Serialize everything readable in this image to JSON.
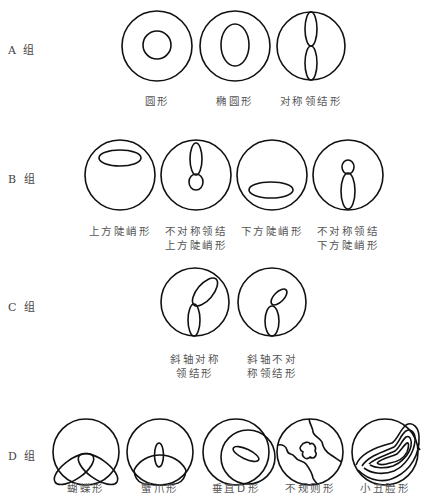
{
  "groups": [
    {
      "label": "A 组",
      "shapes": [
        {
          "name": "圆形"
        },
        {
          "name": "椭圆形"
        },
        {
          "name": "对称领结形"
        }
      ]
    },
    {
      "label": "B 组",
      "shapes": [
        {
          "name": "上方陡峭形"
        },
        {
          "name_line1": "不对称领结",
          "name_line2": "上方陡峭形"
        },
        {
          "name": "下方陡峭形"
        },
        {
          "name_line1": "不对称领结",
          "name_line2": "下方陡峭形"
        }
      ]
    },
    {
      "label": "C 组",
      "shapes": [
        {
          "name_line1": "斜轴对称",
          "name_line2": "领结形"
        },
        {
          "name_line1": "斜轴不对",
          "name_line2": "称领结形"
        }
      ]
    },
    {
      "label": "D 组",
      "shapes": [
        {
          "name": "蝴蝶形"
        },
        {
          "name": "蟹爪形"
        },
        {
          "name": "垂直D形"
        },
        {
          "name": "不规则形"
        },
        {
          "name": "小丑脸形"
        }
      ]
    }
  ],
  "colors": {
    "stroke": "#111111",
    "text": "#555555",
    "background": "#ffffff"
  }
}
